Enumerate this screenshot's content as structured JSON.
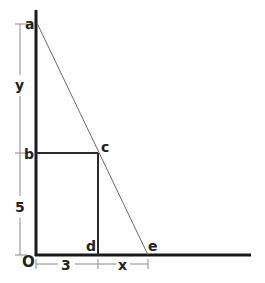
{
  "diagram": {
    "type": "geometry",
    "colors": {
      "axis": "#1a1a1a",
      "rectangle": "#2a2a2a",
      "hypotenuse": "#6a6a6a",
      "dimension": "#8a8a8a",
      "label": "#222222"
    },
    "points": {
      "a": {
        "label": "a"
      },
      "b": {
        "label": "b"
      },
      "c": {
        "label": "c"
      },
      "d": {
        "label": "d"
      },
      "e": {
        "label": "e"
      },
      "o": {
        "label": "O"
      }
    },
    "dimensions": {
      "y": {
        "label": "y"
      },
      "five": {
        "label": "5"
      },
      "three": {
        "label": "3"
      },
      "x": {
        "label": "x"
      }
    }
  }
}
